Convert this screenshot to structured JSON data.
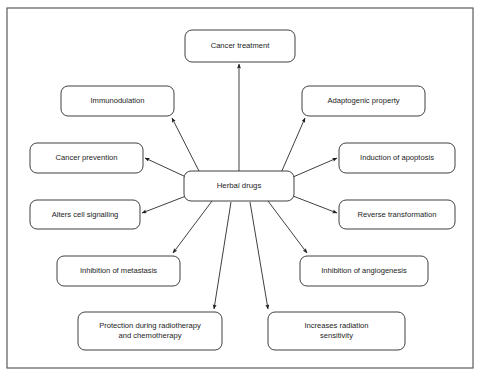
{
  "figure": {
    "type": "radial-concept-map",
    "title_visible": false,
    "frame": {
      "x": 7,
      "y": 8,
      "width": 466,
      "height": 360,
      "stroke": "#5a5a5a"
    },
    "background_color": "#ffffff",
    "text_color": "#1c1c1c",
    "node_stroke_color": "#2b2b2b",
    "arrow_color": "#1c1c1c"
  },
  "center": {
    "id": "herbal-drugs",
    "label": "Herbal drugs",
    "x": 184,
    "y": 171,
    "width": 110,
    "height": 30,
    "rx": 7
  },
  "nodes": [
    {
      "id": "cancer-treatment",
      "label": "Cancer treatment",
      "lines": [
        "Cancer treatment"
      ],
      "x": 185,
      "y": 30,
      "width": 110,
      "height": 32,
      "rx": 7,
      "arrow_from": {
        "x": 239,
        "y": 171
      },
      "arrow_to": {
        "x": 239,
        "y": 64
      }
    },
    {
      "id": "immunodulation",
      "label": "Immunodulation",
      "lines": [
        "Immunodulation"
      ],
      "x": 61,
      "y": 86,
      "width": 113,
      "height": 30,
      "rx": 7,
      "arrow_from": {
        "x": 200,
        "y": 173
      },
      "arrow_to": {
        "x": 172,
        "y": 118
      }
    },
    {
      "id": "adaptogenic-property",
      "label": "Adaptogenic property",
      "lines": [
        "Adaptogenic property"
      ],
      "x": 302,
      "y": 86,
      "width": 123,
      "height": 30,
      "rx": 7,
      "arrow_from": {
        "x": 281,
        "y": 173
      },
      "arrow_to": {
        "x": 305,
        "y": 118
      }
    },
    {
      "id": "cancer-prevention",
      "label": "Cancer prevention",
      "lines": [
        "Cancer prevention"
      ],
      "x": 30,
      "y": 143,
      "width": 113,
      "height": 30,
      "rx": 7,
      "arrow_from": {
        "x": 186,
        "y": 177
      },
      "arrow_to": {
        "x": 145,
        "y": 158
      }
    },
    {
      "id": "induction-of-apoptosis",
      "label": "Induction of apoptosis",
      "lines": [
        "Induction of apoptosis"
      ],
      "x": 339,
      "y": 143,
      "width": 116,
      "height": 30,
      "rx": 7,
      "arrow_from": {
        "x": 293,
        "y": 177
      },
      "arrow_to": {
        "x": 337,
        "y": 158
      }
    },
    {
      "id": "alters-cell-signalling",
      "label": "Alters cell signalling",
      "lines": [
        "Alters cell signalling"
      ],
      "x": 30,
      "y": 200,
      "width": 110,
      "height": 29,
      "rx": 7,
      "arrow_from": {
        "x": 186,
        "y": 196
      },
      "arrow_to": {
        "x": 142,
        "y": 213
      }
    },
    {
      "id": "reverse-transformation",
      "label": "Reverse transformation",
      "lines": [
        "Reverse transformation"
      ],
      "x": 339,
      "y": 200,
      "width": 116,
      "height": 29,
      "rx": 7,
      "arrow_from": {
        "x": 293,
        "y": 196
      },
      "arrow_to": {
        "x": 337,
        "y": 213
      }
    },
    {
      "id": "inhibition-of-metastasis",
      "label": "Inhibition of metastasis",
      "lines": [
        "Inhibition of metastasis"
      ],
      "x": 57,
      "y": 256,
      "width": 123,
      "height": 30,
      "rx": 7,
      "arrow_from": {
        "x": 212,
        "y": 201
      },
      "arrow_to": {
        "x": 173,
        "y": 253
      }
    },
    {
      "id": "inhibition-of-angiogenesis",
      "label": "Inhibition of angiogenesis",
      "lines": [
        "Inhibition of angiogenesis"
      ],
      "x": 300,
      "y": 256,
      "width": 128,
      "height": 30,
      "rx": 7,
      "arrow_from": {
        "x": 268,
        "y": 201
      },
      "arrow_to": {
        "x": 307,
        "y": 253
      }
    },
    {
      "id": "protection-during-radiotherapy-and-chemotherapy",
      "label": "Protection during radiotherapy and chemotherapy",
      "lines": [
        "Protection during radiotherapy",
        "and chemotherapy"
      ],
      "x": 78,
      "y": 312,
      "width": 144,
      "height": 38,
      "rx": 7,
      "arrow_from": {
        "x": 231,
        "y": 202
      },
      "arrow_to": {
        "x": 214,
        "y": 309
      }
    },
    {
      "id": "increases-radiation-sensitivity",
      "label": "Increases radiation sensitivity",
      "lines": [
        "Increases radiation",
        "sensitivity"
      ],
      "x": 268,
      "y": 312,
      "width": 137,
      "height": 38,
      "rx": 7,
      "arrow_from": {
        "x": 250,
        "y": 202
      },
      "arrow_to": {
        "x": 268,
        "y": 309
      }
    }
  ]
}
